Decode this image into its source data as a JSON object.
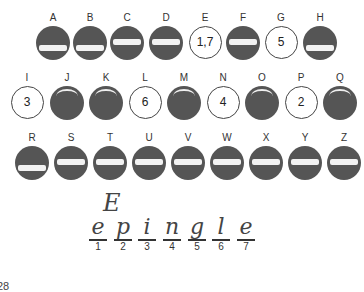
{
  "rows": [
    [
      {
        "letter": "A",
        "type": "filled",
        "band": "low"
      },
      {
        "letter": "B",
        "type": "filled",
        "band": "low"
      },
      {
        "letter": "C",
        "type": "filled",
        "band": "mid"
      },
      {
        "letter": "D",
        "type": "filled",
        "band": "mid"
      },
      {
        "letter": "E",
        "type": "open",
        "number": "1,7"
      },
      {
        "letter": "F",
        "type": "filled",
        "band": "mid"
      },
      {
        "letter": "G",
        "type": "open",
        "number": "5"
      },
      {
        "letter": "H",
        "type": "filled",
        "band": "low"
      }
    ],
    [
      {
        "letter": "I",
        "type": "open",
        "number": "3"
      },
      {
        "letter": "J",
        "type": "filled",
        "band": "arc"
      },
      {
        "letter": "K",
        "type": "filled",
        "band": "arc"
      },
      {
        "letter": "L",
        "type": "open",
        "number": "6"
      },
      {
        "letter": "M",
        "type": "filled",
        "band": "arc"
      },
      {
        "letter": "N",
        "type": "open",
        "number": "4"
      },
      {
        "letter": "O",
        "type": "filled",
        "band": "arc"
      },
      {
        "letter": "P",
        "type": "open",
        "number": "2"
      },
      {
        "letter": "Q",
        "type": "filled",
        "band": "arc"
      }
    ],
    [
      {
        "letter": "R",
        "type": "filled",
        "band": "low"
      },
      {
        "letter": "S",
        "type": "filled",
        "band": "mid"
      },
      {
        "letter": "T",
        "type": "filled",
        "band": "mid"
      },
      {
        "letter": "U",
        "type": "filled",
        "band": "mid"
      },
      {
        "letter": "V",
        "type": "filled",
        "band": "mid"
      },
      {
        "letter": "W",
        "type": "filled",
        "band": "mid"
      },
      {
        "letter": "X",
        "type": "filled",
        "band": "mid"
      },
      {
        "letter": "Y",
        "type": "filled",
        "band": "mid"
      },
      {
        "letter": "Z",
        "type": "filled",
        "band": "mid"
      }
    ]
  ],
  "handwritten_letter": "E",
  "answer_slots": [
    {
      "position": "1",
      "letter": "e"
    },
    {
      "position": "2",
      "letter": "p"
    },
    {
      "position": "3",
      "letter": "i"
    },
    {
      "position": "4",
      "letter": "n"
    },
    {
      "position": "5",
      "letter": "g"
    },
    {
      "position": "6",
      "letter": "l"
    },
    {
      "position": "7",
      "letter": "e"
    }
  ],
  "page_number": "28",
  "colors": {
    "disc_fill": "#555555",
    "disc_band": "#f2f2f2",
    "ink": "#444444"
  }
}
